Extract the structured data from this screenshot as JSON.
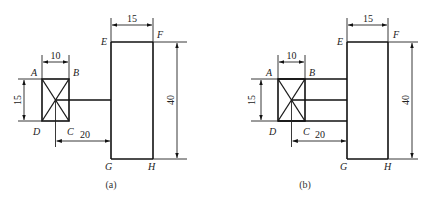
{
  "diagrams": [
    {
      "id": "a",
      "caption": "(a)",
      "labels": {
        "A": "A",
        "B": "B",
        "C": "C",
        "D": "D",
        "E": "E",
        "F": "F",
        "G": "G",
        "H": "H"
      },
      "dimensions": {
        "small_width": "10",
        "small_height": "15",
        "offset": "20",
        "large_width": "15",
        "large_height": "40"
      },
      "connectors": 1
    },
    {
      "id": "b",
      "caption": "(b)",
      "labels": {
        "A": "A",
        "B": "B",
        "C": "C",
        "D": "D",
        "E": "E",
        "F": "F",
        "G": "G",
        "H": "H"
      },
      "dimensions": {
        "small_width": "10",
        "small_height": "15",
        "offset": "20",
        "large_width": "15",
        "large_height": "40"
      },
      "connectors": 3
    }
  ]
}
